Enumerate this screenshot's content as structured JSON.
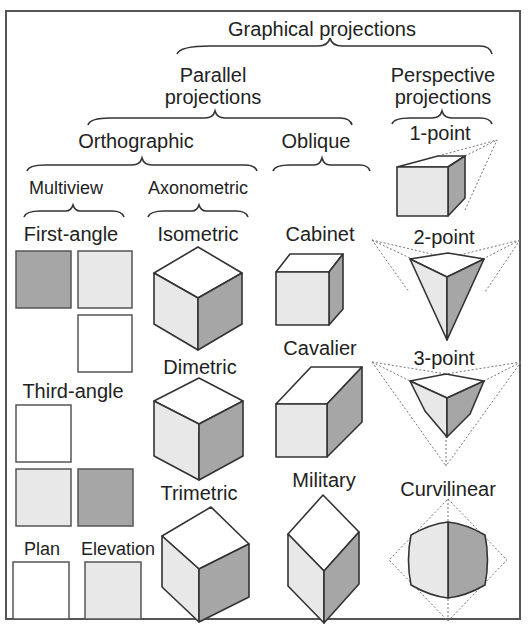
{
  "title": "Graphical projections",
  "colors": {
    "dark": "#a6a6a6",
    "light": "#e8e8e8",
    "white": "#ffffff",
    "line": "#333333",
    "border": "#555555"
  },
  "categories": {
    "parallel": "Parallel projections",
    "parallel_line1": "Parallel",
    "parallel_line2": "projections",
    "perspective_line1": "Perspective",
    "perspective_line2": "projections",
    "orthographic": "Orthographic",
    "oblique": "Oblique",
    "multiview": "Multiview",
    "axonometric": "Axonometric"
  },
  "multiview": {
    "first_angle": "First-angle",
    "third_angle": "Third-angle",
    "plan": "Plan",
    "elevation": "Elevation"
  },
  "axonometric": {
    "isometric": "Isometric",
    "dimetric": "Dimetric",
    "trimetric": "Trimetric"
  },
  "oblique": {
    "cabinet": "Cabinet",
    "cavalier": "Cavalier",
    "military": "Military"
  },
  "perspective": {
    "one_point": "1-point",
    "two_point": "2-point",
    "three_point": "3-point",
    "curvilinear": "Curvilinear"
  }
}
